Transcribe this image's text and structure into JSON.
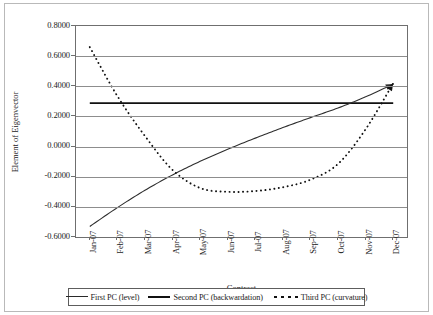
{
  "chart_data": {
    "type": "line",
    "title": "",
    "xlabel": "Contract",
    "ylabel": "Element of Eigenvector",
    "categories": [
      "Jan-07",
      "Feb-07",
      "Mar-07",
      "Apr-07",
      "May-07",
      "Jun-07",
      "Jul-07",
      "Aug-07",
      "Sep-07",
      "Oct-07",
      "Nov-07",
      "Dec-07"
    ],
    "ylim": [
      -0.6,
      0.8
    ],
    "ytick_labels": [
      "0.8000",
      "0.6000",
      "0.4000",
      "0.2000",
      "0.0000",
      "-0.2000",
      "-0.4000",
      "-0.6000"
    ],
    "ytick_values": [
      0.8,
      0.6,
      0.4,
      0.2,
      0.0,
      -0.2,
      -0.4,
      -0.6
    ],
    "grid": "horizontal",
    "legend_position": "bottom",
    "series": [
      {
        "name": "First PC (level)",
        "style": "solid-thick",
        "values": [
          0.288,
          0.288,
          0.288,
          0.288,
          0.288,
          0.288,
          0.288,
          0.288,
          0.288,
          0.288,
          0.288,
          0.288
        ]
      },
      {
        "name": "Second PC (backwardation)",
        "style": "solid-thin",
        "values": [
          -0.53,
          -0.405,
          -0.29,
          -0.188,
          -0.098,
          -0.018,
          0.056,
          0.126,
          0.192,
          0.256,
          0.33,
          0.415
        ]
      },
      {
        "name": "Third PC (curvature)",
        "style": "dotted",
        "values": [
          0.66,
          0.335,
          0.07,
          -0.155,
          -0.275,
          -0.3,
          -0.295,
          -0.27,
          -0.22,
          -0.115,
          0.115,
          0.42
        ]
      }
    ]
  },
  "legend": {
    "items": [
      {
        "label": "First PC (level)"
      },
      {
        "label": "Second PC (backwardation)"
      },
      {
        "label": "Third PC (curvature)"
      }
    ]
  }
}
